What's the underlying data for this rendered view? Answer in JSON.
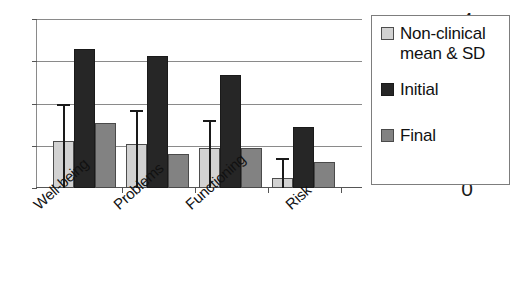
{
  "chart_data": {
    "type": "bar",
    "title": "",
    "subtitle": "",
    "xlabel": "",
    "ylabel": "",
    "ylim": [
      0,
      4
    ],
    "yticks": [
      "0",
      "1",
      "2",
      "3",
      "4"
    ],
    "grid": true,
    "legend_position": "right",
    "categories": [
      "Well-being",
      "Problems",
      "Functioning",
      "Risk"
    ],
    "series": [
      {
        "name": "Non-clinical mean & SD",
        "color": "#d2d2d2",
        "values": [
          1.12,
          1.05,
          0.95,
          0.23
        ],
        "errors_upper": [
          2.0,
          1.85,
          1.62,
          0.72
        ]
      },
      {
        "name": "Initial",
        "color": "#262626",
        "values": [
          3.28,
          3.13,
          2.68,
          1.45
        ]
      },
      {
        "name": "Final",
        "color": "#828282",
        "values": [
          1.55,
          0.81,
          0.94,
          0.61
        ]
      }
    ]
  },
  "legend": {
    "entries": [
      {
        "label_line1": "Non-clinical",
        "label_line2": "mean & SD"
      },
      {
        "label_line1": "Initial",
        "label_line2": ""
      },
      {
        "label_line1": "Final",
        "label_line2": ""
      }
    ]
  }
}
